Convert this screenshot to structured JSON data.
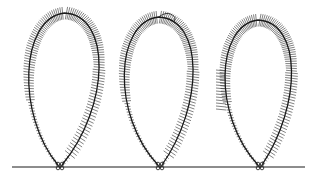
{
  "figure": {
    "stroke_color": "#1a1a1a",
    "background": "#ffffff",
    "baseline": {
      "x1": 12,
      "x2": 305,
      "y": 167
    },
    "loops": [
      {
        "id": "loop-1",
        "base_x": 60,
        "left": 22,
        "right": 107,
        "top": 13,
        "fringe_side": "both"
      },
      {
        "id": "loop-2",
        "base_x": 160,
        "left": 117,
        "right": 200,
        "top": 17,
        "fringe_side": "both",
        "top_hook": true
      },
      {
        "id": "loop-3",
        "base_x": 260,
        "left": 218,
        "right": 298,
        "top": 20,
        "fringe_side": "both",
        "side_tuft": true
      }
    ]
  }
}
